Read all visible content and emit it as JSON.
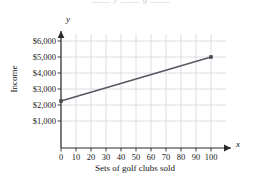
{
  "page": {
    "clipped_header_text": "____ y ____ g ____"
  },
  "chart_data": {
    "type": "line",
    "title": "",
    "xlabel": "Sets of golf clubs sold",
    "ylabel": "Income",
    "x_axis_variable": "x",
    "y_axis_variable": "y",
    "x": [
      0,
      100
    ],
    "values": [
      2250,
      5000
    ],
    "categories": [
      "0",
      "100"
    ],
    "series": [
      {
        "name": "Income",
        "points": [
          {
            "x": 0,
            "y": 2250
          },
          {
            "x": 100,
            "y": 5000
          }
        ]
      }
    ],
    "xticks": [
      0,
      10,
      20,
      30,
      40,
      50,
      60,
      70,
      80,
      90,
      100
    ],
    "xticklabels": [
      "0",
      "10",
      "20",
      "30",
      "40",
      "50",
      "60",
      "70",
      "80",
      "90",
      "100"
    ],
    "yticks": [
      1000,
      2000,
      3000,
      4000,
      5000,
      6000
    ],
    "yticklabels": [
      "$1,000",
      "$2,000",
      "$3,000",
      "$4,000",
      "$5,000",
      "$6,000"
    ],
    "xlim": [
      0,
      100
    ],
    "ylim": [
      0,
      6500
    ],
    "grid": true,
    "legend": "none",
    "line_color": "#585862",
    "grid_color": "#d6d6dc",
    "axis_color": "#2a2a2a",
    "marker": "square",
    "marker_color": "#4a4a52"
  }
}
